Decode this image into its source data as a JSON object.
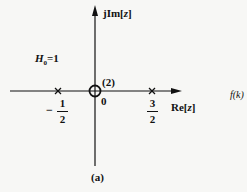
{
  "diagram": {
    "type": "pole-zero plot (z-plane)",
    "axes": {
      "imag_label_prefix": "jIm[",
      "imag_label_var": "z",
      "imag_label_suffix": "]",
      "real_label_prefix": "Re[",
      "real_label_var": "z",
      "real_label_suffix": "]"
    },
    "gain_label": {
      "symbol": "H",
      "subscript": "0",
      "value": "=1"
    },
    "zero": {
      "position": "0",
      "multiplicity_label": "(2)",
      "origin_label": "0"
    },
    "poles": [
      {
        "sign": "−",
        "numerator": "1",
        "denominator": "2",
        "value": -0.5
      },
      {
        "sign": "",
        "numerator": "3",
        "denominator": "2",
        "value": 1.5
      }
    ],
    "caption": "(a)",
    "side_text": "f(k)"
  }
}
